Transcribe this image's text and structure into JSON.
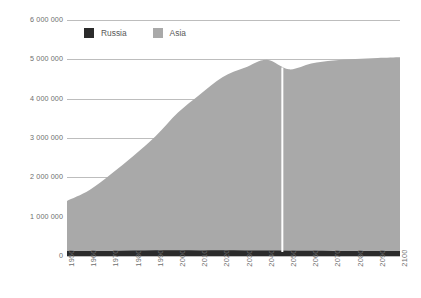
{
  "chart_data": {
    "type": "area",
    "title": "",
    "subtitle": "",
    "xlabel": "",
    "ylabel": "",
    "stacked": true,
    "grid": true,
    "legend_position": "top-left",
    "xlim": [
      1950,
      2100
    ],
    "ylim": [
      0,
      6000000
    ],
    "yticks": [
      0,
      1000000,
      2000000,
      3000000,
      4000000,
      5000000,
      6000000
    ],
    "ytick_labels": [
      "0",
      "1 000 000",
      "2 000 000",
      "3 000 000",
      "4 000 000",
      "5 000 000",
      "6 000 000"
    ],
    "x": [
      1950,
      1960,
      1970,
      1980,
      1990,
      2000,
      2010,
      2020,
      2030,
      2040,
      2050,
      2060,
      2070,
      2080,
      2090,
      2100
    ],
    "xtick_labels": [
      "1950",
      "1960",
      "1970",
      "1980",
      "1990",
      "2000",
      "2010",
      "2020",
      "2030",
      "2040",
      "2050",
      "2060",
      "2070",
      "2080",
      "2090",
      "2100"
    ],
    "series": [
      {
        "name": "Russia",
        "color": "#2b2b2b",
        "values": [
          130000,
          130000,
          130000,
          140000,
          148000,
          146000,
          143000,
          146000,
          143000,
          139000,
          135000,
          132000,
          130000,
          128000,
          126000,
          124000
        ]
      },
      {
        "name": "Asia",
        "color": "#a9a9a9",
        "values": [
          1270000,
          1540000,
          1960000,
          2410000,
          2900000,
          3500000,
          3970000,
          4400000,
          4640000,
          4850000,
          4610000,
          4760000,
          4840000,
          4880000,
          4910000,
          4930000
        ]
      }
    ],
    "stack_totals": [
      1400000,
      1670000,
      2090000,
      2550000,
      3048000,
      3646000,
      4113000,
      4546000,
      4783000,
      4989000,
      4745000,
      4892000,
      4970000,
      5008000,
      5036000,
      5054000
    ],
    "annotations": [
      {
        "type": "vertical-line",
        "label": "",
        "x": 2047,
        "color": "#ffffff"
      }
    ]
  },
  "legend": {
    "items": [
      {
        "label": "Russia",
        "color": "#2b2b2b"
      },
      {
        "label": "Asia",
        "color": "#a9a9a9"
      }
    ]
  }
}
